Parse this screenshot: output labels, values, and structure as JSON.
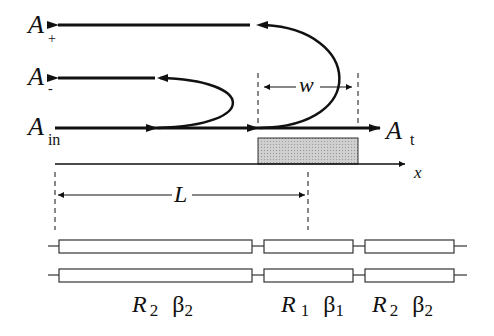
{
  "labels": {
    "a_plus": {
      "main": "A",
      "sub": "+"
    },
    "a_minus": {
      "main": "A",
      "sub": "-"
    },
    "a_in": {
      "main": "A",
      "sub": "in"
    },
    "a_t": {
      "main": "A",
      "sub": "t"
    },
    "x_axis": "x",
    "width": "w",
    "length": "L"
  },
  "sections": [
    {
      "r": "R",
      "r_sub": "2",
      "beta": "β",
      "beta_sub": "2"
    },
    {
      "r": "R",
      "r_sub": "1",
      "beta": "β",
      "beta_sub": "1"
    },
    {
      "r": "R",
      "r_sub": "2",
      "beta": "β",
      "beta_sub": "2"
    }
  ],
  "colors": {
    "line": "#111111",
    "shade": "#c8c8c8"
  }
}
